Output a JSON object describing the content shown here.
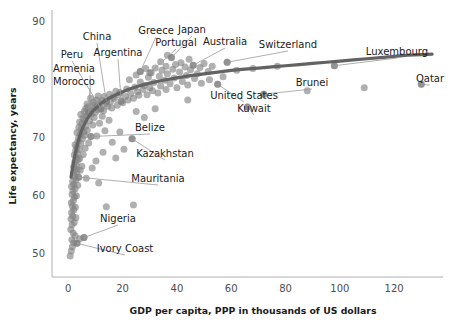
{
  "chart_data": {
    "type": "scatter",
    "title": "",
    "xlabel": "GDP per capita, PPP in thousands of US dollars",
    "ylabel": "Life expectancy, years",
    "xlim": [
      -6,
      138
    ],
    "ylim": [
      46,
      92
    ],
    "xticks": [
      0,
      20,
      40,
      60,
      80,
      100,
      120
    ],
    "xtick_labels": [
      "0",
      "20",
      "40",
      "60",
      "80",
      "100",
      "120"
    ],
    "yticks": [
      50,
      60,
      70,
      80,
      90
    ],
    "ytick_labels": [
      "50",
      "60",
      "70",
      "80",
      "90"
    ],
    "grid": false,
    "legend": null,
    "marker_color": "#808080",
    "marker_opacity": 0.62,
    "trend_color": "#636363",
    "trend_label": "lowess fit",
    "trend_points": [
      [
        1.0,
        63.2
      ],
      [
        2.0,
        66.0
      ],
      [
        3.0,
        68.2
      ],
      [
        4.0,
        70.0
      ],
      [
        5.0,
        71.4
      ],
      [
        7.0,
        73.3
      ],
      [
        9.0,
        74.6
      ],
      [
        12.0,
        75.9
      ],
      [
        15.0,
        76.8
      ],
      [
        18.0,
        77.5
      ],
      [
        22.0,
        78.3
      ],
      [
        26.0,
        78.9
      ],
      [
        30.0,
        79.4
      ],
      [
        35.0,
        79.9
      ],
      [
        40.0,
        80.3
      ],
      [
        45.0,
        80.7
      ],
      [
        50.0,
        81.0
      ],
      [
        55.0,
        81.3
      ],
      [
        60.0,
        81.6
      ],
      [
        65.0,
        81.8
      ],
      [
        70.0,
        82.0
      ],
      [
        75.0,
        82.2
      ],
      [
        80.0,
        82.4
      ],
      [
        85.0,
        82.6
      ],
      [
        90.0,
        82.8
      ],
      [
        95.0,
        83.0
      ],
      [
        100.0,
        83.2
      ],
      [
        105.0,
        83.4
      ],
      [
        110.0,
        83.6
      ],
      [
        115.0,
        83.8
      ],
      [
        120.0,
        84.0
      ],
      [
        125.0,
        84.2
      ],
      [
        130.0,
        84.3
      ],
      [
        134.0,
        84.4
      ]
    ],
    "annotations": [
      {
        "label": "China",
        "x": 14.0,
        "y": 76.3,
        "tx": 97,
        "ty": 40,
        "anchor": "middle"
      },
      {
        "label": "Greece",
        "x": 26.5,
        "y": 81.4,
        "tx": 156,
        "ty": 34,
        "anchor": "middle"
      },
      {
        "label": "Japan",
        "x": 38.0,
        "y": 83.8,
        "tx": 192,
        "ty": 33,
        "anchor": "middle"
      },
      {
        "label": "Peru",
        "x": 12.0,
        "y": 75.0,
        "tx": 72,
        "ty": 58,
        "anchor": "middle"
      },
      {
        "label": "Argentina",
        "x": 19.5,
        "y": 76.3,
        "tx": 118,
        "ty": 56,
        "anchor": "middle"
      },
      {
        "label": "Portugal",
        "x": 30.0,
        "y": 81.2,
        "tx": 176,
        "ty": 46,
        "anchor": "middle"
      },
      {
        "label": "Australia",
        "x": 46.0,
        "y": 82.5,
        "tx": 225,
        "ty": 45,
        "anchor": "middle"
      },
      {
        "label": "Switzerland",
        "x": 58.5,
        "y": 83.0,
        "tx": 288,
        "ty": 48,
        "anchor": "middle"
      },
      {
        "label": "Luxembourg",
        "x": 98.0,
        "y": 82.4,
        "tx": 397,
        "ty": 55,
        "anchor": "middle"
      },
      {
        "label": "Armenia",
        "x": 8.0,
        "y": 74.6,
        "tx": 53,
        "ty": 72,
        "anchor": "start"
      },
      {
        "label": "Morocco",
        "x": 7.5,
        "y": 74.2,
        "tx": 53,
        "ty": 85,
        "anchor": "start"
      },
      {
        "label": "Brunei",
        "x": 72.0,
        "y": 77.5,
        "tx": 312,
        "ty": 86,
        "anchor": "middle"
      },
      {
        "label": "Qatar",
        "x": 130.0,
        "y": 79.2,
        "tx": 430,
        "ty": 82,
        "anchor": "middle"
      },
      {
        "label": "United States",
        "x": 55.0,
        "y": 79.2,
        "tx": 244,
        "ty": 99,
        "anchor": "middle"
      },
      {
        "label": "Kuwait",
        "x": 66.0,
        "y": 75.3,
        "tx": 254,
        "ty": 112,
        "anchor": "middle"
      },
      {
        "label": "Belize",
        "x": 8.3,
        "y": 70.2,
        "tx": 150,
        "ty": 131,
        "anchor": "middle"
      },
      {
        "label": "Kazakhstan",
        "x": 23.5,
        "y": 69.8,
        "tx": 165,
        "ty": 157,
        "anchor": "middle"
      },
      {
        "label": "Mauritania",
        "x": 3.8,
        "y": 63.2,
        "tx": 158,
        "ty": 182,
        "anchor": "middle"
      },
      {
        "label": "Nigeria",
        "x": 5.8,
        "y": 52.8,
        "tx": 118,
        "ty": 222,
        "anchor": "middle"
      },
      {
        "label": "Ivory Coast",
        "x": 3.2,
        "y": 51.8,
        "tx": 125,
        "ty": 252,
        "anchor": "middle"
      }
    ],
    "points": [
      [
        0.7,
        49.6
      ],
      [
        1.1,
        50.5
      ],
      [
        1.5,
        51.2
      ],
      [
        2.0,
        51.9
      ],
      [
        3.2,
        51.8
      ],
      [
        1.3,
        52.4
      ],
      [
        2.5,
        53.1
      ],
      [
        4.2,
        52.6
      ],
      [
        5.8,
        52.8
      ],
      [
        1.8,
        53.6
      ],
      [
        0.9,
        54.2
      ],
      [
        1.4,
        55.0
      ],
      [
        2.2,
        55.4
      ],
      [
        1.0,
        56.0
      ],
      [
        1.6,
        56.5
      ],
      [
        2.8,
        56.2
      ],
      [
        1.2,
        57.1
      ],
      [
        2.0,
        57.6
      ],
      [
        1.5,
        58.2
      ],
      [
        2.6,
        58.0
      ],
      [
        1.1,
        58.8
      ],
      [
        1.9,
        59.2
      ],
      [
        2.3,
        59.8
      ],
      [
        1.4,
        60.2
      ],
      [
        3.0,
        60.0
      ],
      [
        1.7,
        60.8
      ],
      [
        2.5,
        61.2
      ],
      [
        1.2,
        61.6
      ],
      [
        2.0,
        62.0
      ],
      [
        3.5,
        61.8
      ],
      [
        1.6,
        62.5
      ],
      [
        2.8,
        62.8
      ],
      [
        3.8,
        63.2
      ],
      [
        2.2,
        63.4
      ],
      [
        1.9,
        63.9
      ],
      [
        3.2,
        64.2
      ],
      [
        2.6,
        64.6
      ],
      [
        4.4,
        64.4
      ],
      [
        2.0,
        65.0
      ],
      [
        3.0,
        65.3
      ],
      [
        5.0,
        65.1
      ],
      [
        2.4,
        65.8
      ],
      [
        3.6,
        66.2
      ],
      [
        2.9,
        66.6
      ],
      [
        4.2,
        66.4
      ],
      [
        2.2,
        67.0
      ],
      [
        3.3,
        67.3
      ],
      [
        5.5,
        67.1
      ],
      [
        2.7,
        67.8
      ],
      [
        4.0,
        68.0
      ],
      [
        3.1,
        68.4
      ],
      [
        6.2,
        68.2
      ],
      [
        2.5,
        68.8
      ],
      [
        4.6,
        69.0
      ],
      [
        3.5,
        69.3
      ],
      [
        7.5,
        69.1
      ],
      [
        8.3,
        70.2
      ],
      [
        5.2,
        69.8
      ],
      [
        3.8,
        70.0
      ],
      [
        6.0,
        70.4
      ],
      [
        4.4,
        70.6
      ],
      [
        10.5,
        70.3
      ],
      [
        3.2,
        70.9
      ],
      [
        5.8,
        71.0
      ],
      [
        7.0,
        71.3
      ],
      [
        4.8,
        71.5
      ],
      [
        13.5,
        71.2
      ],
      [
        3.9,
        71.8
      ],
      [
        6.5,
        72.0
      ],
      [
        9.0,
        72.2
      ],
      [
        5.0,
        72.4
      ],
      [
        11.5,
        72.5
      ],
      [
        4.2,
        72.7
      ],
      [
        7.8,
        72.9
      ],
      [
        6.0,
        73.1
      ],
      [
        15.0,
        73.0
      ],
      [
        5.4,
        73.4
      ],
      [
        9.5,
        73.5
      ],
      [
        12.5,
        73.7
      ],
      [
        6.8,
        73.8
      ],
      [
        4.6,
        74.0
      ],
      [
        8.5,
        74.1
      ],
      [
        7.5,
        74.3
      ],
      [
        10.0,
        74.4
      ],
      [
        5.9,
        74.5
      ],
      [
        8.0,
        74.6
      ],
      [
        13.0,
        74.7
      ],
      [
        11.0,
        74.8
      ],
      [
        6.4,
        75.0
      ],
      [
        12.0,
        75.0
      ],
      [
        9.8,
        75.2
      ],
      [
        16.0,
        75.1
      ],
      [
        7.2,
        75.3
      ],
      [
        14.5,
        75.4
      ],
      [
        10.8,
        75.5
      ],
      [
        8.8,
        75.6
      ],
      [
        18.0,
        75.6
      ],
      [
        6.9,
        75.8
      ],
      [
        13.8,
        75.9
      ],
      [
        11.8,
        76.0
      ],
      [
        9.2,
        76.1
      ],
      [
        20.0,
        76.0
      ],
      [
        15.5,
        76.2
      ],
      [
        14.0,
        76.3
      ],
      [
        12.6,
        76.4
      ],
      [
        10.4,
        76.5
      ],
      [
        19.5,
        76.3
      ],
      [
        22.0,
        76.5
      ],
      [
        17.0,
        76.7
      ],
      [
        8.2,
        76.8
      ],
      [
        24.0,
        76.8
      ],
      [
        16.5,
        77.0
      ],
      [
        13.2,
        77.1
      ],
      [
        11.0,
        77.2
      ],
      [
        21.0,
        77.1
      ],
      [
        26.0,
        77.3
      ],
      [
        18.5,
        77.4
      ],
      [
        15.2,
        77.5
      ],
      [
        29.0,
        77.4
      ],
      [
        23.0,
        77.6
      ],
      [
        19.0,
        77.8
      ],
      [
        33.0,
        77.7
      ],
      [
        25.5,
        77.9
      ],
      [
        17.5,
        78.0
      ],
      [
        31.0,
        78.1
      ],
      [
        27.5,
        78.3
      ],
      [
        21.5,
        78.4
      ],
      [
        36.0,
        78.3
      ],
      [
        30.0,
        78.6
      ],
      [
        24.5,
        78.7
      ],
      [
        40.0,
        78.6
      ],
      [
        34.0,
        78.9
      ],
      [
        28.0,
        79.0
      ],
      [
        55.0,
        79.2
      ],
      [
        44.0,
        79.1
      ],
      [
        37.5,
        79.3
      ],
      [
        31.5,
        79.5
      ],
      [
        49.0,
        79.4
      ],
      [
        26.5,
        79.6
      ],
      [
        42.0,
        79.7
      ],
      [
        35.5,
        79.9
      ],
      [
        22.5,
        80.0
      ],
      [
        52.0,
        80.0
      ],
      [
        46.5,
        80.2
      ],
      [
        39.0,
        80.3
      ],
      [
        29.5,
        80.4
      ],
      [
        33.5,
        80.6
      ],
      [
        57.0,
        80.5
      ],
      [
        43.5,
        80.7
      ],
      [
        25.0,
        80.8
      ],
      [
        36.5,
        81.0
      ],
      [
        47.5,
        81.0
      ],
      [
        30.5,
        81.2
      ],
      [
        26.5,
        81.4
      ],
      [
        41.0,
        81.3
      ],
      [
        51.5,
        81.4
      ],
      [
        34.5,
        81.6
      ],
      [
        45.0,
        81.7
      ],
      [
        38.5,
        81.8
      ],
      [
        28.5,
        81.9
      ],
      [
        32.0,
        82.0
      ],
      [
        48.5,
        82.1
      ],
      [
        43.0,
        82.2
      ],
      [
        36.0,
        82.3
      ],
      [
        53.0,
        82.3
      ],
      [
        46.0,
        82.5
      ],
      [
        39.5,
        82.6
      ],
      [
        58.5,
        83.0
      ],
      [
        41.5,
        82.9
      ],
      [
        34.0,
        83.1
      ],
      [
        38.0,
        83.8
      ],
      [
        44.5,
        83.5
      ],
      [
        36.5,
        84.2
      ],
      [
        50.0,
        82.8
      ],
      [
        98.0,
        82.4
      ],
      [
        66.0,
        75.3
      ],
      [
        72.0,
        77.5
      ],
      [
        130.0,
        79.2
      ],
      [
        109.0,
        78.6
      ],
      [
        88.0,
        78.1
      ],
      [
        23.5,
        69.8
      ],
      [
        14.0,
        58.1
      ],
      [
        24.0,
        58.4
      ],
      [
        62.0,
        81.6
      ],
      [
        68.0,
        81.9
      ],
      [
        77.0,
        82.3
      ],
      [
        20.5,
        68.0
      ],
      [
        17.5,
        66.5
      ],
      [
        12.8,
        67.5
      ],
      [
        16.2,
        69.2
      ],
      [
        10.2,
        66.0
      ],
      [
        28.0,
        73.5
      ],
      [
        19.0,
        71.0
      ],
      [
        25.0,
        74.5
      ],
      [
        32.0,
        75.0
      ],
      [
        44.0,
        76.5
      ],
      [
        8.8,
        64.8
      ],
      [
        6.6,
        63.0
      ],
      [
        11.2,
        62.2
      ]
    ]
  }
}
